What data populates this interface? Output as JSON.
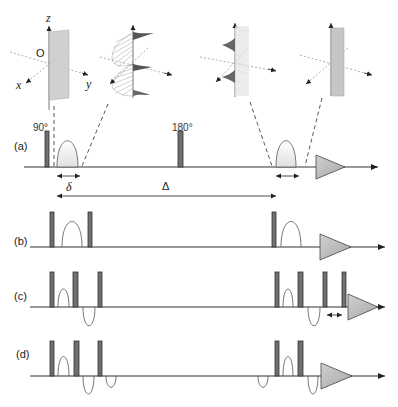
{
  "figure": {
    "coordinate_frame": {
      "axis_labels": {
        "z": "z",
        "x": "x",
        "y": "y",
        "origin": "O"
      },
      "insets": [
        {
          "name": "after-90-pulse",
          "shape": "plane"
        },
        {
          "name": "after-first-gradient",
          "shape": "helix"
        },
        {
          "name": "before-second-gradient",
          "shape": "helix"
        },
        {
          "name": "after-refocusing",
          "shape": "plane"
        }
      ]
    },
    "sequences": [
      {
        "label": "(a)",
        "pulse_labels": {
          "p90": "90°",
          "p180": "180°"
        },
        "delays": {
          "delta": "δ",
          "Delta": "Δ"
        }
      },
      {
        "label": "(b)"
      },
      {
        "label": "(c)"
      },
      {
        "label": "(d)"
      }
    ],
    "colors": {
      "pulse": "#707070",
      "axis": "#333333",
      "gradient_fill": "#e6e6e6",
      "acquisition_fill": "#b8b8b8"
    }
  }
}
